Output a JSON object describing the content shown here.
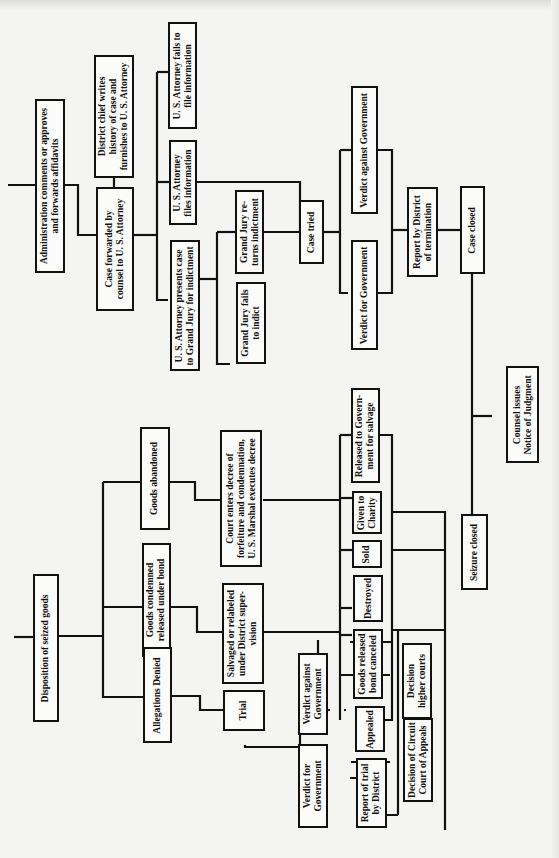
{
  "diagram": {
    "orientation": "rotated-90-ccw",
    "line_color": "#111111",
    "background": "#f4f4f2",
    "nodes": {
      "admin": "Administration comments or approves\nand forwards affidavits",
      "district_chief": "District chief writes\nhistory of case and\nfurnishes to U. S. Attorney",
      "case_forwarded": "Case forwarded by\ncounsel to U. S. Attorney",
      "usa_fails_info": "U. S. Attorney fails to\nfile information",
      "usa_files_info": "U. S. Attorney\nfiles information",
      "usa_grand_jury": "U. S. Attorney presents case\nto Grand Jury for indictment",
      "gj_returns": "Grand Jury re-\nturns indictment",
      "gj_fails": "Grand Jury fails\nto indict",
      "case_tried": "Case tried",
      "verdict_against_gov_top": "Verdict against Government",
      "verdict_for_gov_top": "Verdict for Government",
      "report_termination": "Report by District\nof termination",
      "case_closed": "Case closed",
      "counsel_issues": "Counsel issues\nNotice of Judgment",
      "disposition": "Disposition of seized goods",
      "goods_abandoned": "Goods abandoned",
      "goods_condemned": "Goods condemned\nreleased under bond",
      "allegations_denied": "Allegations Denied",
      "court_enters": "Court enters decree of\nforfeiture and condemnation,\nU. S. Marshal executes decree",
      "salvaged": "Salvaged or relabeled\nunder District super-\nvision",
      "trial": "Trial",
      "released_salvage": "Released to Govern-\nment for salvage",
      "given_charity": "Given to\nCharity",
      "sold": "Sold",
      "destroyed": "Destroyed",
      "seizure_closed": "Seizure closed",
      "goods_released_bond": "Goods released\nbond canceled",
      "verdict_against_gov_bottom": "Verdict against\nGovernment",
      "verdict_for_gov_bottom": "Verdict for\nGovernment",
      "appealed": "Appealed",
      "decision_higher": "Decision\nhigher courts",
      "decision_circuit": "Decision of Circuit\nCourt of Appeals",
      "report_trial": "Report of trial\nby District"
    }
  }
}
